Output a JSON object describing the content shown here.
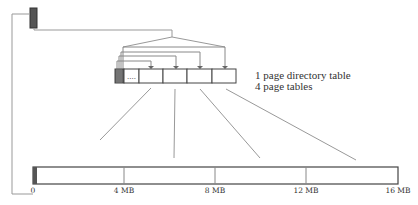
{
  "legend": {
    "line1": "1 page directory table",
    "line2": "4 page tables"
  },
  "memory_bar": {
    "ticks": [
      {
        "label": "0",
        "x": 33
      },
      {
        "label": "4 MB",
        "x": 124
      },
      {
        "label": "8 MB",
        "x": 215
      },
      {
        "label": "12 MB",
        "x": 306
      },
      {
        "label": "16 MB",
        "x": 398
      }
    ]
  },
  "page_table_row": {
    "ellipsis": "...."
  },
  "colors": {
    "line": "#888888",
    "dark_fill": "#555555",
    "box_stroke": "#444444"
  }
}
